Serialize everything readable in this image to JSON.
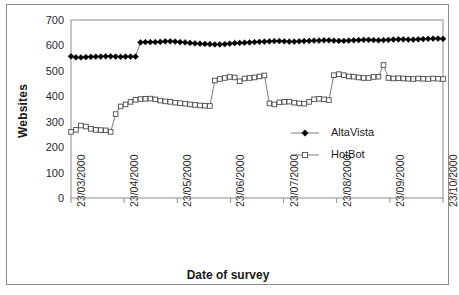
{
  "chart_data": {
    "type": "line",
    "title": "",
    "xlabel": "Date of survey",
    "ylabel": "Websites",
    "ylim": [
      0,
      700
    ],
    "yticks": [
      0,
      100,
      200,
      300,
      400,
      500,
      600,
      700
    ],
    "xtick_labels": [
      "23/03/2000",
      "23/04/2000",
      "23/05/2000",
      "23/06/2000",
      "23/07/2000",
      "23/08/2000",
      "23/09/2000",
      "23/10/2000"
    ],
    "xlim_labels": [
      "23/03/2000",
      "23/10/2000"
    ],
    "grid": false,
    "legend_position": "center-right",
    "series": [
      {
        "name": "AltaVista",
        "marker": "filled-diamond",
        "color": "#000000",
        "x": [
          0,
          2,
          4,
          6,
          8,
          10,
          12,
          14,
          16,
          18,
          20,
          22,
          24,
          26,
          28,
          30,
          32,
          34,
          36,
          38,
          40,
          42,
          44,
          46,
          48,
          50,
          52,
          54,
          56,
          58,
          60,
          62,
          64,
          66,
          68,
          70,
          72,
          74,
          76,
          78,
          80,
          82,
          84,
          86,
          88,
          90,
          92,
          94,
          96,
          98,
          100,
          102,
          104,
          106,
          108,
          110,
          112,
          114,
          116,
          118,
          120,
          122,
          124,
          126,
          128,
          130,
          132,
          134,
          136,
          138,
          140,
          142,
          144,
          146,
          148,
          150
        ],
        "values": [
          557,
          553,
          553,
          554,
          555,
          556,
          556,
          557,
          557,
          556,
          555,
          556,
          556,
          556,
          612,
          613,
          613,
          613,
          614,
          616,
          616,
          615,
          613,
          612,
          610,
          608,
          607,
          606,
          605,
          604,
          604,
          605,
          607,
          609,
          610,
          611,
          612,
          613,
          614,
          615,
          616,
          617,
          617,
          616,
          615,
          615,
          616,
          617,
          618,
          619,
          619,
          620,
          620,
          619,
          618,
          618,
          619,
          620,
          621,
          622,
          622,
          621,
          620,
          621,
          622,
          623,
          624,
          624,
          623,
          623,
          624,
          625,
          626,
          627,
          627,
          626
        ]
      },
      {
        "name": "HotBot",
        "marker": "open-square",
        "color": "#000000",
        "x": [
          0,
          2,
          4,
          6,
          8,
          10,
          12,
          14,
          16,
          18,
          20,
          22,
          24,
          26,
          28,
          30,
          32,
          34,
          36,
          38,
          40,
          42,
          44,
          46,
          48,
          50,
          52,
          54,
          56,
          58,
          60,
          62,
          64,
          66,
          68,
          70,
          72,
          74,
          76,
          78,
          80,
          82,
          84,
          86,
          88,
          90,
          92,
          94,
          96,
          98,
          100,
          102,
          104,
          106,
          108,
          110,
          112,
          114,
          116,
          118,
          120,
          122,
          124,
          126,
          128,
          130,
          132,
          134,
          136,
          138,
          140,
          142,
          144,
          146,
          148,
          150
        ],
        "values": [
          260,
          268,
          285,
          281,
          272,
          268,
          267,
          266,
          260,
          330,
          360,
          368,
          378,
          386,
          389,
          390,
          391,
          388,
          383,
          380,
          378,
          375,
          373,
          371,
          368,
          366,
          364,
          363,
          362,
          462,
          468,
          472,
          476,
          474,
          459,
          470,
          472,
          474,
          478,
          482,
          372,
          368,
          376,
          378,
          379,
          375,
          372,
          371,
          378,
          388,
          390,
          388,
          385,
          483,
          487,
          483,
          478,
          477,
          474,
          472,
          472,
          476,
          477,
          523,
          472,
          470,
          471,
          470,
          469,
          468,
          470,
          469,
          468,
          470,
          469,
          468
        ]
      }
    ],
    "annotations": {
      "altavista_step": "Step increase around 23/04/2000 from ~555 to ~615",
      "hotbot_plateau": "Plateau near 470 between 23/06/2000 and 23/07/2000",
      "hotbot_spike": "Single spike to ~525 in late 23/09/2000"
    }
  },
  "legend": {
    "items": [
      {
        "label": "AltaVista",
        "marker": "filled-diamond"
      },
      {
        "label": "HotBot",
        "marker": "open-square"
      }
    ]
  },
  "axes": {
    "y_title": "Websites",
    "x_title": "Date of survey"
  }
}
